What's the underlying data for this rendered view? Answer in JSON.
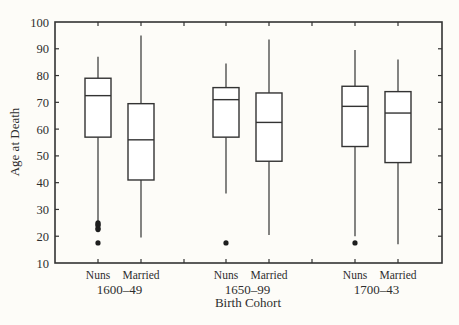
{
  "chart_data": {
    "type": "box",
    "title": "",
    "xlabel": "Birth Cohort",
    "ylabel": "Age at Death",
    "ylim": [
      10,
      100
    ],
    "yticks": [
      10,
      20,
      30,
      40,
      50,
      60,
      70,
      80,
      90,
      100
    ],
    "grid": false,
    "legend": null,
    "groups": [
      {
        "cohort": "1600–49",
        "boxes": [
          {
            "label": "Nuns",
            "whisker_low": 25,
            "q1": 57,
            "median": 72.5,
            "q3": 79,
            "whisker_high": 87,
            "outliers": [
              25,
              24.5,
              24,
              23,
              22.5,
              17.5
            ]
          },
          {
            "label": "Married",
            "whisker_low": 19.5,
            "q1": 41,
            "median": 56,
            "q3": 69.5,
            "whisker_high": 95,
            "outliers": []
          }
        ]
      },
      {
        "cohort": "1650–99",
        "boxes": [
          {
            "label": "Nuns",
            "whisker_low": 36,
            "q1": 57,
            "median": 71,
            "q3": 75.5,
            "whisker_high": 84.5,
            "outliers": [
              17.5
            ]
          },
          {
            "label": "Married",
            "whisker_low": 20.5,
            "q1": 48,
            "median": 62.5,
            "q3": 73.5,
            "whisker_high": 93.5,
            "outliers": []
          }
        ]
      },
      {
        "cohort": "1700–43",
        "boxes": [
          {
            "label": "Nuns",
            "whisker_low": 20,
            "q1": 53.5,
            "median": 68.5,
            "q3": 76,
            "whisker_high": 89.5,
            "outliers": [
              17.5
            ]
          },
          {
            "label": "Married",
            "whisker_low": 17,
            "q1": 47.5,
            "median": 66,
            "q3": 74,
            "whisker_high": 86,
            "outliers": []
          }
        ]
      }
    ]
  },
  "axis": {
    "ylabel": "Age at Death",
    "xlabel": "Birth Cohort"
  },
  "colors": {
    "background": "#fdfcf8",
    "line": "#333333",
    "box_fill": "#ffffff"
  }
}
